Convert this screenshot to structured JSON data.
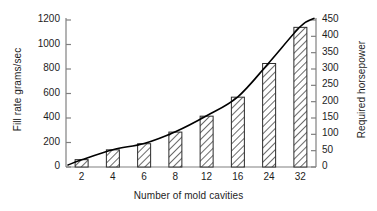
{
  "chart_data": {
    "type": "bar",
    "title": "",
    "subtitle": "",
    "xlabel": "Number of mold cavities",
    "ylabel": "Fill rate grams/sec",
    "y2label": "Required horsepower",
    "categories": [
      "2",
      "4",
      "6",
      "8",
      "12",
      "16",
      "24",
      "32"
    ],
    "series": [
      {
        "name": "Fill rate grams/sec",
        "type": "bar",
        "values": [
          60,
          140,
          190,
          285,
          415,
          570,
          845,
          1140
        ]
      },
      {
        "name": "Required horsepower",
        "type": "line",
        "values": [
          22,
          53,
          72,
          108,
          157,
          215,
          320,
          430
        ]
      }
    ],
    "ylim": [
      0,
      1200
    ],
    "y2lim": [
      0,
      450
    ],
    "yticks": [
      "0",
      "200",
      "400",
      "600",
      "800",
      "1000",
      "1200"
    ],
    "ytick_values": [
      0,
      200,
      400,
      600,
      800,
      1000,
      1200
    ],
    "y2ticks": [
      "0",
      "50",
      "100",
      "150",
      "200",
      "250",
      "300",
      "350",
      "400",
      "450"
    ],
    "y2tick_values": [
      0,
      50,
      100,
      150,
      200,
      250,
      300,
      350,
      400,
      450
    ],
    "grid": false,
    "legend": "none",
    "bar_fill": "diagonal-hatch",
    "line_color": "#000000",
    "axis_color": "#808080",
    "text_color": "#1d1d1d",
    "background": "#ffffff"
  }
}
